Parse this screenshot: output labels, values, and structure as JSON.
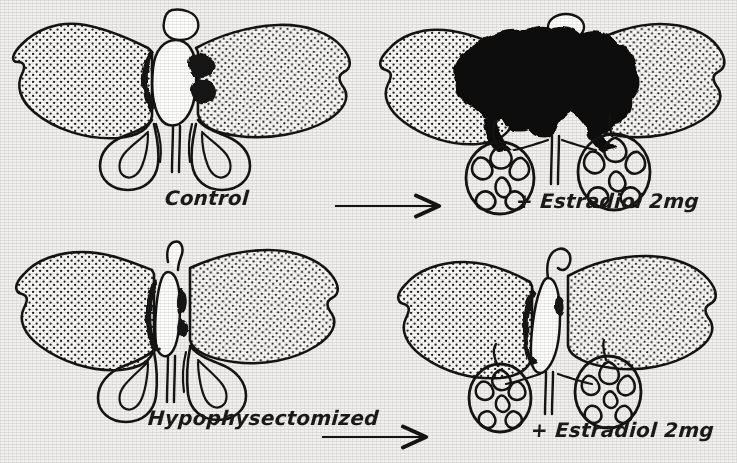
{
  "figure": {
    "type": "scientific-line-drawing",
    "background_color": "#f2f0ee",
    "ink_color": "#141414",
    "layout": "2x2 grid of specimen drawings with horizontal arrows between columns"
  },
  "panels": [
    {
      "id": "top-left",
      "label": "Control",
      "label_position": "below-right",
      "pituitary_state": "normal",
      "pituitary_color": "#ffffff",
      "lesion_marks": "small black patches flanking the central gland",
      "horns_state": "smooth, uncoiled loops",
      "fill": "stippled"
    },
    {
      "id": "top-right",
      "label": "+ Estradiol 2mg",
      "label_position": "below-right",
      "pituitary_state": "massively enlarged tumour",
      "pituitary_color": "#101010",
      "lesion_marks": "large solid black mass replacing central region",
      "horns_state": "densely convoluted / coiled",
      "fill": "stippled"
    },
    {
      "id": "bottom-left",
      "label": "Hypophysectomized",
      "label_position": "below-right",
      "pituitary_state": "removed, thin stalk remains",
      "pituitary_color": "#ffffff",
      "lesion_marks": "narrow black sliver along the stalk",
      "horns_state": "smooth, uncoiled loops",
      "fill": "stippled"
    },
    {
      "id": "bottom-right",
      "label": "+ Estradiol 2mg",
      "label_position": "below-right",
      "pituitary_state": "stalk only, slight darkening",
      "pituitary_color": "#ffffff",
      "lesion_marks": "thin black shading beside the stalk",
      "horns_state": "convoluted / coiled",
      "fill": "stippled"
    }
  ],
  "arrows": [
    {
      "id": "arrow-top",
      "from_panel": "top-left",
      "to_panel": "top-right",
      "direction": "right"
    },
    {
      "id": "arrow-bottom",
      "from_panel": "bottom-left",
      "to_panel": "bottom-right",
      "direction": "right"
    }
  ],
  "labels": {
    "control": "Control",
    "hypophysectomized": "Hypophysectomized",
    "estradiol_top": "+ Estradiol 2mg",
    "estradiol_bottom": "+ Estradiol 2mg"
  }
}
